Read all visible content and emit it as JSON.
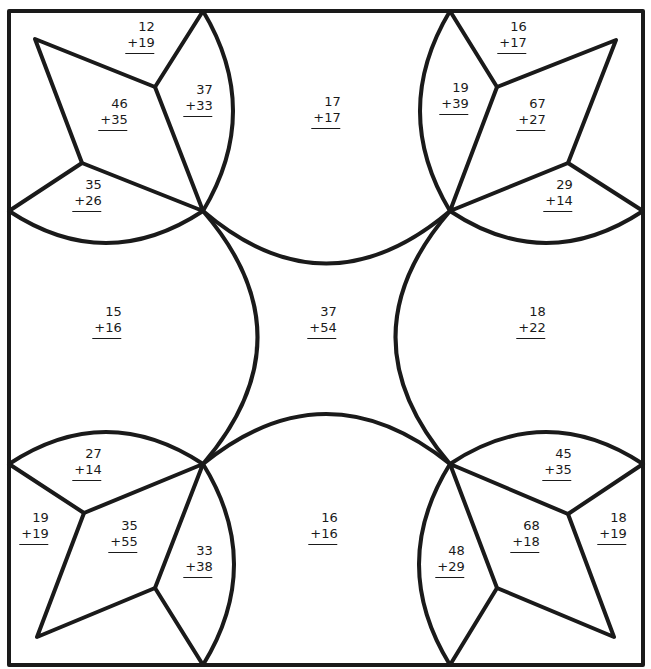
{
  "worksheet": {
    "type": "addition coloring worksheet",
    "colors": {
      "ink": "#1a1a1a",
      "paper": "#ffffff"
    },
    "regions": [
      {
        "id": "tl-top",
        "a": "12",
        "b": "+19",
        "x": 141,
        "y": 19
      },
      {
        "id": "tl-kite",
        "a": "46",
        "b": "+35",
        "x": 114,
        "y": 96
      },
      {
        "id": "tl-petal-r",
        "a": "37",
        "b": "+33",
        "x": 199,
        "y": 82
      },
      {
        "id": "tl-petal-b",
        "a": "35",
        "b": "+26",
        "x": 88,
        "y": 177
      },
      {
        "id": "top-center",
        "a": "17",
        "b": "+17",
        "x": 327,
        "y": 94
      },
      {
        "id": "tr-petal-l",
        "a": "19",
        "b": "+39",
        "x": 455,
        "y": 80
      },
      {
        "id": "tr-top",
        "a": "16",
        "b": "+17",
        "x": 513,
        "y": 19
      },
      {
        "id": "tr-kite",
        "a": "67",
        "b": "+27",
        "x": 532,
        "y": 96
      },
      {
        "id": "tr-petal-b",
        "a": "29",
        "b": "+14",
        "x": 559,
        "y": 177
      },
      {
        "id": "left-center",
        "a": "15",
        "b": "+16",
        "x": 108,
        "y": 304
      },
      {
        "id": "center",
        "a": "37",
        "b": "+54",
        "x": 323,
        "y": 304
      },
      {
        "id": "right-center",
        "a": "18",
        "b": "+22",
        "x": 532,
        "y": 304
      },
      {
        "id": "bl-petal-t",
        "a": "27",
        "b": "+14",
        "x": 88,
        "y": 446
      },
      {
        "id": "bl-side",
        "a": "19",
        "b": "+19",
        "x": 35,
        "y": 510
      },
      {
        "id": "bl-kite",
        "a": "35",
        "b": "+55",
        "x": 124,
        "y": 518
      },
      {
        "id": "bl-petal-r",
        "a": "33",
        "b": "+38",
        "x": 199,
        "y": 543
      },
      {
        "id": "bottom-center",
        "a": "16",
        "b": "+16",
        "x": 324,
        "y": 510
      },
      {
        "id": "br-petal-l",
        "a": "48",
        "b": "+29",
        "x": 451,
        "y": 543
      },
      {
        "id": "br-kite",
        "a": "68",
        "b": "+18",
        "x": 526,
        "y": 518
      },
      {
        "id": "br-petal-t",
        "a": "45",
        "b": "+35",
        "x": 558,
        "y": 446
      },
      {
        "id": "br-side",
        "a": "18",
        "b": "+19",
        "x": 613,
        "y": 510
      }
    ]
  }
}
